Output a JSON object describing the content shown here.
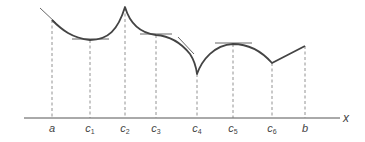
{
  "diagram": {
    "type": "function-curve-with-critical-points",
    "axis_label": "x",
    "points": [
      {
        "key": "a",
        "base": "a",
        "sub": "",
        "x": 52,
        "y": 20
      },
      {
        "key": "c1",
        "base": "c",
        "sub": "1",
        "x": 90,
        "y": 40
      },
      {
        "key": "c2",
        "base": "c",
        "sub": "2",
        "x": 125,
        "y": 6
      },
      {
        "key": "c3",
        "base": "c",
        "sub": "3",
        "x": 156,
        "y": 34
      },
      {
        "key": "c4",
        "base": "c",
        "sub": "4",
        "x": 197,
        "y": 74
      },
      {
        "key": "c5",
        "base": "c",
        "sub": "5",
        "x": 233,
        "y": 44
      },
      {
        "key": "c6",
        "base": "c",
        "sub": "6",
        "x": 272,
        "y": 63
      },
      {
        "key": "b",
        "base": "b",
        "sub": "",
        "x": 305,
        "y": 46
      }
    ],
    "colors": {
      "curve": "#444444",
      "tangent": "#555555",
      "dashed": "#777777",
      "axis": "#555555",
      "text": "#444444"
    }
  }
}
